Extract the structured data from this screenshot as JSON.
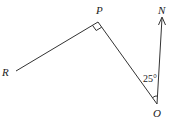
{
  "diagram": {
    "points": {
      "P": {
        "label": "P"
      },
      "R": {
        "label": "R"
      },
      "O": {
        "label": "O"
      },
      "N": {
        "label": "N"
      }
    },
    "angle_label": "25°",
    "right_angle_at": "P",
    "colors": {
      "line": "#333333",
      "text": "#222222",
      "background": "#ffffff"
    }
  }
}
